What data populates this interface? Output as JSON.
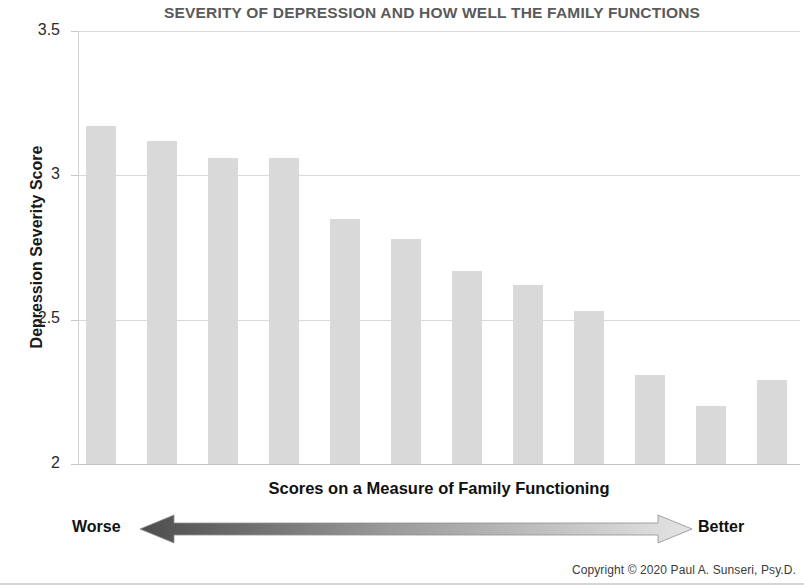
{
  "chart_data": {
    "type": "bar",
    "title": "SEVERITY OF DEPRESSION AND HOW WELL THE FAMILY FUNCTIONS",
    "xlabel": "Scores on a Measure of Family Functioning",
    "ylabel": "Depression Severity Score",
    "categories": [
      "1",
      "2",
      "3",
      "4",
      "5",
      "6",
      "7",
      "8",
      "9",
      "10",
      "11",
      "12"
    ],
    "values": [
      3.17,
      3.12,
      3.06,
      3.06,
      2.85,
      2.78,
      2.67,
      2.62,
      2.53,
      2.31,
      2.2,
      2.29
    ],
    "ylim": [
      2,
      3.5
    ],
    "ytick_labels": [
      "3.5",
      "3",
      "2.5",
      "2"
    ],
    "yticks": [
      3.5,
      3,
      2.5,
      2
    ],
    "grid": true,
    "xtick_labels": [],
    "legend": null,
    "bar_color": "#d9d9d9",
    "annotations": {
      "axis_scale_left": "Worse",
      "axis_scale_right": "Better",
      "arrow_gradient_from": "#4d4d4d",
      "arrow_gradient_to": "#e2e2e2"
    }
  },
  "footer": {
    "copyright": "Copyright © 2020 Paul A. Sunseri, Psy.D."
  },
  "colors": {
    "title": "#5a5a5a",
    "gridline": "#d8d8d8",
    "text": "#111111"
  }
}
